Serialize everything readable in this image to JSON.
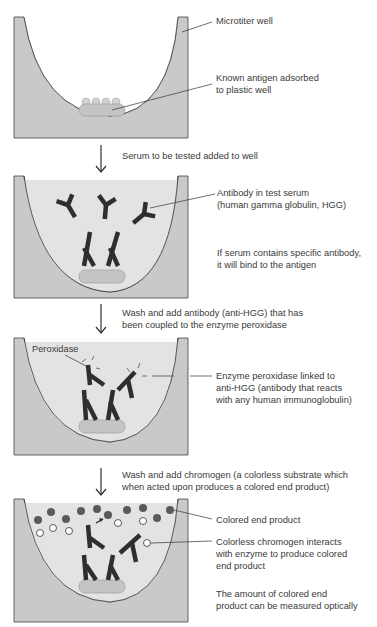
{
  "colors": {
    "well_wall": "#c9c9c9",
    "serum_fill": "#e3e3e3",
    "antibody": "#2e2e2e",
    "colored_product": "#5a5a5a",
    "colorless_chromogen": "#ffffff",
    "antigen": "#c4c4c4",
    "line": "#333333"
  },
  "panels": [
    {
      "labels": [
        {
          "text": "Microtiter well"
        },
        {
          "text": "Known antigen adsorbed\nto plastic well"
        }
      ]
    },
    {
      "step": "Serum to be tested added to well",
      "labels": [
        {
          "text": "Antibody in test serum\n(human gamma globulin, HGG)"
        },
        {
          "text": "If serum contains specific antibody,\nit will bind to the antigen"
        }
      ]
    },
    {
      "step": "Wash and add antibody (anti-HGG) that has\nbeen coupled to the enzyme peroxidase",
      "labels": [
        {
          "text": "Peroxidase"
        },
        {
          "text": "Enzyme peroxidase linked to\nanti-HGG (antibody that reacts\nwith any human immunoglobulin)"
        }
      ]
    },
    {
      "step": "Wash and add chromogen (a colorless substrate which\nwhen acted upon produces a colored end product)",
      "labels": [
        {
          "text": "Colored end product"
        },
        {
          "text": "Colorless chromogen interacts\nwith enzyme to produce colored\nend product"
        },
        {
          "text": "The amount of colored end\nproduct can be measured optically"
        }
      ]
    }
  ]
}
